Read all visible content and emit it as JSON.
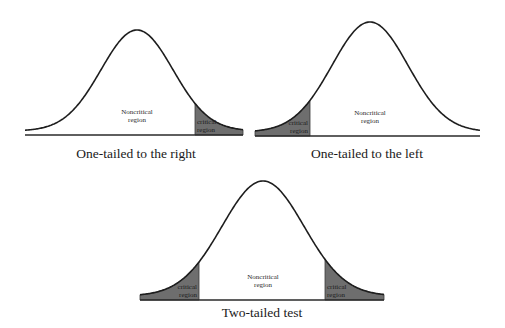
{
  "colors": {
    "background": "#ffffff",
    "curve": "#1e1e1e",
    "critical_fill": "#6e6e6e",
    "baseline": "#2a2a2a"
  },
  "panels": [
    {
      "id": "right",
      "caption": "One-tailed to the right",
      "noncritical_label_line1": "Noncritical",
      "noncritical_label_line2": "region",
      "critical_label_line1": "critical",
      "critical_label_line2": "region",
      "curve": {
        "x_start": 25,
        "x_end": 243,
        "peak_x": 137,
        "peak_y": 30,
        "baseline_y": 135,
        "sigma": 36
      },
      "critical_regions": [
        {
          "side": "right",
          "x_from": 195,
          "x_to": 243
        }
      ]
    },
    {
      "id": "left",
      "caption": "One-tailed to the left",
      "noncritical_label_line1": "Noncritical",
      "noncritical_label_line2": "region",
      "critical_label_line1": "critical",
      "critical_label_line2": "region",
      "curve": {
        "x_start": 255,
        "x_end": 480,
        "peak_x": 370,
        "peak_y": 22,
        "baseline_y": 136,
        "sigma": 38
      },
      "critical_regions": [
        {
          "side": "left",
          "x_from": 255,
          "x_to": 310
        }
      ]
    },
    {
      "id": "two",
      "caption": "Two-tailed test",
      "noncritical_label_line1": "Noncritical",
      "noncritical_label_line2": "region",
      "critical_label_line1": "critical",
      "critical_label_line2": "region",
      "curve": {
        "x_start": 140,
        "x_end": 384,
        "peak_x": 263,
        "peak_y": 181,
        "baseline_y": 300,
        "sigma": 41
      },
      "critical_regions": [
        {
          "side": "left",
          "x_from": 140,
          "x_to": 199
        },
        {
          "side": "right",
          "x_from": 325,
          "x_to": 384
        }
      ]
    }
  ]
}
